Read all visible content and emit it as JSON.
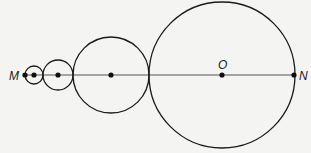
{
  "diagram": {
    "line": {
      "from": "M",
      "to": "N",
      "y": 75,
      "x1": 25,
      "x2": 294
    },
    "labels": {
      "M": "M",
      "O": "O",
      "N": "N"
    },
    "circles": [
      {
        "cx": 34,
        "cy": 75,
        "r": 9
      },
      {
        "cx": 58,
        "cy": 75,
        "r": 15
      },
      {
        "cx": 111,
        "cy": 75,
        "r": 38
      },
      {
        "cx": 222,
        "cy": 75,
        "r": 73
      }
    ],
    "points": [
      {
        "name": "M",
        "x": 25,
        "y": 75
      },
      {
        "name": "center-1",
        "x": 34,
        "y": 75
      },
      {
        "name": "center-2",
        "x": 58,
        "y": 75
      },
      {
        "name": "center-3",
        "x": 111,
        "y": 75
      },
      {
        "name": "O",
        "x": 222,
        "y": 75
      },
      {
        "name": "N",
        "x": 294,
        "y": 75
      }
    ],
    "stroke_color": "#1a1a1a",
    "background": "#f4f4f2"
  }
}
